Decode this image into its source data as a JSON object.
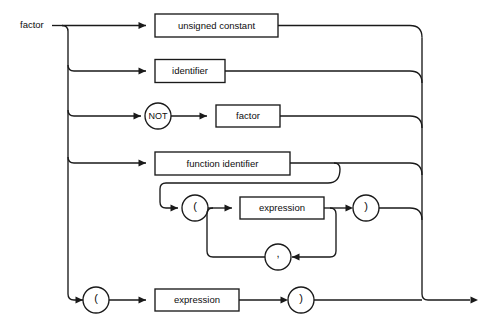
{
  "diagram": {
    "title": "factor",
    "type": "railroad-syntax-diagram",
    "start_label": "factor",
    "stroke_color": "#1a1a1a",
    "background_color": "#ffffff",
    "boxes": [
      {
        "id": "unsigned-constant",
        "label": "unsigned constant"
      },
      {
        "id": "identifier",
        "label": "identifier"
      },
      {
        "id": "factor",
        "label": "factor"
      },
      {
        "id": "function-identifier",
        "label": "function identifier"
      },
      {
        "id": "expression-args",
        "label": "expression"
      },
      {
        "id": "expression-paren",
        "label": "expression"
      }
    ],
    "terminals": [
      {
        "id": "not-keyword",
        "label": "NOT"
      },
      {
        "id": "lparen-args",
        "label": "("
      },
      {
        "id": "rparen-args",
        "label": ")"
      },
      {
        "id": "comma-separator",
        "label": ","
      },
      {
        "id": "lparen-group",
        "label": "("
      },
      {
        "id": "rparen-group",
        "label": ")"
      }
    ],
    "alternatives": [
      "unsigned constant",
      "identifier",
      "NOT factor",
      "function identifier ( expression { , expression } )",
      "( expression )"
    ]
  }
}
